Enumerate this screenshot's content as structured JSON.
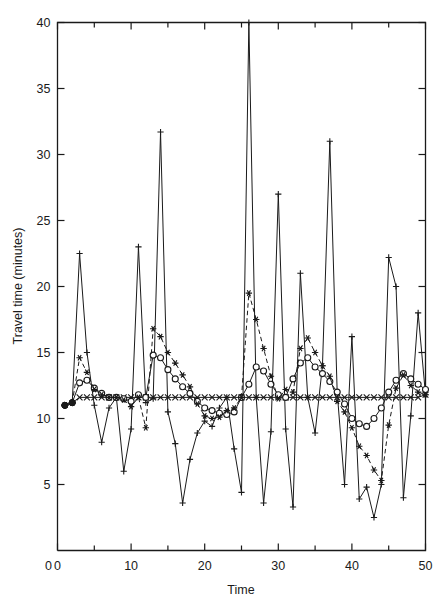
{
  "figure": {
    "background": "#ffffff",
    "ink": "#1a1a1a"
  },
  "chart_data": {
    "type": "line",
    "title": "",
    "subtitle": "",
    "xlabel": "Time",
    "ylabel": "Travel time (minutes)",
    "xlim": [
      0,
      50
    ],
    "ylim": [
      0,
      40
    ],
    "xticks": [
      0,
      10,
      20,
      30,
      40,
      50
    ],
    "xticks_minor": [
      5,
      15,
      25,
      35,
      45
    ],
    "yticks": [
      0,
      5,
      10,
      15,
      20,
      25,
      30,
      35,
      40
    ],
    "xtick_labels": [
      "0",
      "10",
      "20",
      "30",
      "40",
      "50"
    ],
    "ytick_labels": [
      "0",
      "5",
      "10",
      "15",
      "20",
      "25",
      "30",
      "35",
      "40"
    ],
    "grid": false,
    "legend": "none",
    "legend_position": "none",
    "marker_names": [
      "filled-circle",
      "open-circle",
      "x-cross",
      "plus",
      "star"
    ],
    "x": [
      1,
      2,
      3,
      4,
      5,
      6,
      7,
      8,
      9,
      10,
      11,
      12,
      13,
      14,
      15,
      16,
      17,
      18,
      19,
      20,
      21,
      22,
      23,
      24,
      25,
      26,
      27,
      28,
      29,
      30,
      31,
      32,
      33,
      34,
      35,
      36,
      37,
      38,
      39,
      40,
      41,
      42,
      43,
      44,
      45,
      46,
      47,
      48,
      49,
      50
    ],
    "series": [
      {
        "name": "observed",
        "marker": "plus",
        "linestyle": "solid",
        "color": "#1a1a1a",
        "values": [
          11.0,
          11.2,
          22.5,
          15.0,
          11.0,
          8.2,
          10.8,
          11.6,
          6.0,
          9.2,
          23.0,
          11.2,
          11.5,
          31.7,
          10.5,
          8.1,
          3.6,
          6.9,
          8.9,
          9.8,
          9.4,
          10.8,
          11.6,
          7.7,
          4.4,
          40.0,
          11.6,
          3.6,
          9.0,
          27.0,
          9.2,
          3.3,
          21.0,
          11.6,
          8.9,
          14.0,
          31.0,
          12.0,
          5.0,
          16.2,
          3.9,
          4.8,
          2.5,
          5.0,
          22.2,
          20.0,
          4.0,
          10.2,
          18.0,
          11.8
        ]
      },
      {
        "name": "predictor-x",
        "marker": "x-cross",
        "linestyle": "solid",
        "color": "#1a1a1a",
        "values": [
          11.0,
          11.2,
          11.6,
          11.6,
          11.6,
          11.6,
          11.6,
          11.6,
          11.6,
          11.6,
          11.6,
          11.6,
          11.6,
          11.6,
          11.6,
          11.6,
          11.6,
          11.6,
          11.6,
          11.6,
          11.6,
          11.6,
          11.6,
          11.6,
          11.6,
          11.6,
          11.6,
          11.6,
          11.6,
          11.6,
          11.6,
          11.6,
          11.6,
          11.6,
          11.6,
          11.6,
          11.6,
          11.6,
          11.6,
          11.6,
          11.6,
          11.6,
          11.6,
          11.6,
          11.6,
          11.6,
          11.6,
          11.6,
          11.6,
          11.8
        ]
      },
      {
        "name": "forecast-o",
        "marker": "open-circle",
        "linestyle": "solid",
        "color": "#1a1a1a",
        "values": [
          11.0,
          11.2,
          12.7,
          12.9,
          12.3,
          11.9,
          11.6,
          11.6,
          11.5,
          11.3,
          11.8,
          11.6,
          14.8,
          14.6,
          13.7,
          13.0,
          12.4,
          11.9,
          11.3,
          10.8,
          10.6,
          10.4,
          10.3,
          10.5,
          11.6,
          12.6,
          13.9,
          13.6,
          12.6,
          11.8,
          11.6,
          13.0,
          14.2,
          14.6,
          13.9,
          13.4,
          12.8,
          12.0,
          11.1,
          10.0,
          9.6,
          9.4,
          10.0,
          10.8,
          12.0,
          12.9,
          13.4,
          13.0,
          12.6,
          12.2
        ]
      },
      {
        "name": "forecast-star",
        "marker": "star",
        "linestyle": "dashed",
        "color": "#1a1a1a",
        "values": [
          11.0,
          11.2,
          14.6,
          13.5,
          12.2,
          11.8,
          11.6,
          11.6,
          11.4,
          10.9,
          11.6,
          9.3,
          16.8,
          16.2,
          15.0,
          14.2,
          13.3,
          12.4,
          11.1,
          10.2,
          10.0,
          10.1,
          10.6,
          10.8,
          11.6,
          19.5,
          17.5,
          15.3,
          13.2,
          11.5,
          12.2,
          12.0,
          15.3,
          16.1,
          15.0,
          14.0,
          13.2,
          11.3,
          10.5,
          9.3,
          7.9,
          7.2,
          6.1,
          5.3,
          9.5,
          12.3,
          13.3,
          12.5,
          12.0,
          11.8
        ]
      }
    ]
  }
}
